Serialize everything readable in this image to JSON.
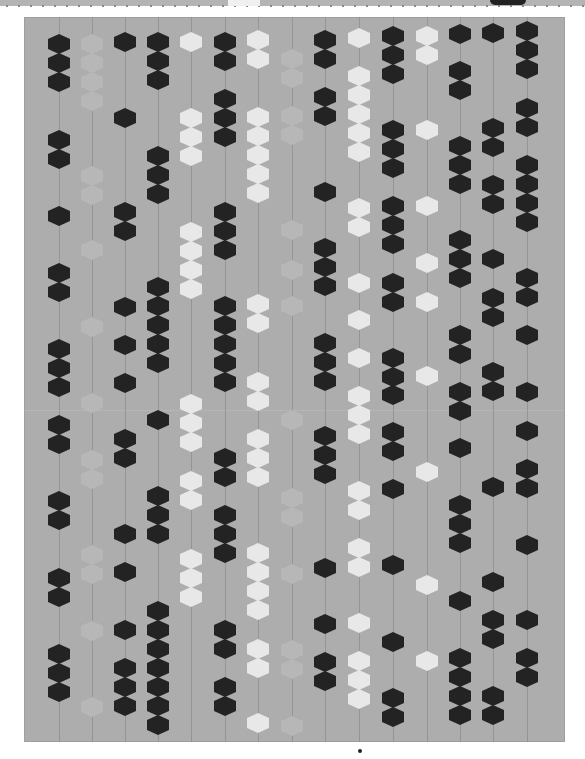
{
  "image": {
    "subject": "modern hexagon quilt photographed flat on white background",
    "colors": {
      "background_fabric": "#adadad",
      "dark_hex": "#232323",
      "white_hex": "#e8e8e8",
      "faint_hex": "#b7b7b7",
      "page": "#ffffff"
    },
    "quilt_bounds": {
      "x": 24,
      "y": 17,
      "width": 541,
      "height": 725
    },
    "bottom_dot": {
      "x": 360,
      "y": 751
    },
    "top_strip": {
      "gaps": [
        {
          "x": 228,
          "w": 32
        }
      ],
      "patches": [
        {
          "x": 490,
          "w": 36
        }
      ]
    },
    "columns": [
      {
        "x": 59,
        "tone": "dark",
        "y": [
          44,
          63,
          82,
          140,
          159,
          216,
          273,
          292,
          349,
          368,
          387,
          425,
          444,
          501,
          520,
          578,
          597,
          654,
          673,
          692
        ]
      },
      {
        "x": 92,
        "tone": "faint",
        "y": [
          44,
          63,
          82,
          101,
          176,
          195,
          250,
          327,
          403,
          460,
          479,
          555,
          574,
          631,
          707
        ]
      },
      {
        "x": 125,
        "tone": "dark",
        "y": [
          42,
          118,
          212,
          231,
          307,
          345,
          383,
          439,
          458,
          534,
          572,
          630,
          668,
          687,
          706
        ]
      },
      {
        "x": 158,
        "tone": "dark",
        "y": [
          42,
          61,
          80,
          156,
          175,
          194,
          287,
          306,
          325,
          344,
          363,
          420,
          496,
          515,
          534,
          611,
          630,
          649,
          668,
          687,
          706,
          725
        ]
      },
      {
        "x": 191,
        "tone": "white",
        "y": [
          42,
          118,
          137,
          156,
          232,
          251,
          270,
          289,
          404,
          423,
          442,
          481,
          500,
          559,
          578,
          597
        ]
      },
      {
        "x": 225,
        "tone": "dark",
        "y": [
          42,
          61,
          99,
          118,
          137,
          212,
          231,
          250,
          306,
          325,
          344,
          363,
          382,
          458,
          477,
          515,
          534,
          553,
          630,
          649,
          687,
          706
        ]
      },
      {
        "x": 258,
        "tone": "white",
        "y": [
          40,
          59,
          117,
          136,
          155,
          174,
          193,
          304,
          323,
          382,
          401,
          439,
          458,
          477,
          553,
          572,
          591,
          610,
          649,
          668,
          723
        ]
      },
      {
        "x": 292,
        "tone": "faint",
        "y": [
          59,
          78,
          116,
          135,
          230,
          270,
          306,
          420,
          498,
          517,
          574,
          650,
          669,
          726
        ]
      },
      {
        "x": 325,
        "tone": "dark",
        "y": [
          40,
          59,
          97,
          116,
          192,
          248,
          267,
          286,
          343,
          362,
          381,
          436,
          455,
          474,
          568,
          624,
          662,
          681
        ]
      },
      {
        "x": 359,
        "tone": "white",
        "y": [
          38,
          76,
          95,
          114,
          133,
          152,
          208,
          227,
          283,
          320,
          358,
          396,
          415,
          434,
          491,
          510,
          548,
          567,
          623,
          661,
          680,
          699
        ]
      },
      {
        "x": 393,
        "tone": "dark",
        "y": [
          36,
          55,
          74,
          130,
          149,
          168,
          206,
          225,
          244,
          283,
          302,
          358,
          377,
          395,
          432,
          451,
          489,
          565,
          642,
          698,
          717
        ]
      },
      {
        "x": 427,
        "tone": "white",
        "y": [
          36,
          55,
          130,
          206,
          263,
          302,
          376,
          472,
          585,
          661
        ]
      },
      {
        "x": 460,
        "tone": "dark",
        "y": [
          34,
          71,
          90,
          146,
          165,
          184,
          240,
          259,
          278,
          335,
          354,
          392,
          411,
          448,
          505,
          524,
          543,
          601,
          658,
          677,
          696,
          715
        ]
      },
      {
        "x": 493,
        "tone": "dark",
        "y": [
          33,
          128,
          147,
          185,
          204,
          259,
          298,
          317,
          372,
          391,
          487,
          582,
          620,
          639,
          696,
          715
        ]
      },
      {
        "x": 527,
        "tone": "dark",
        "y": [
          31,
          50,
          69,
          108,
          127,
          165,
          184,
          203,
          222,
          278,
          297,
          335,
          392,
          431,
          469,
          488,
          545,
          620,
          658,
          677
        ]
      }
    ],
    "quilting_lines_x": [
      59,
      92,
      125,
      158,
      191,
      225,
      258,
      292,
      325,
      359,
      393,
      427,
      460,
      493,
      527
    ]
  }
}
